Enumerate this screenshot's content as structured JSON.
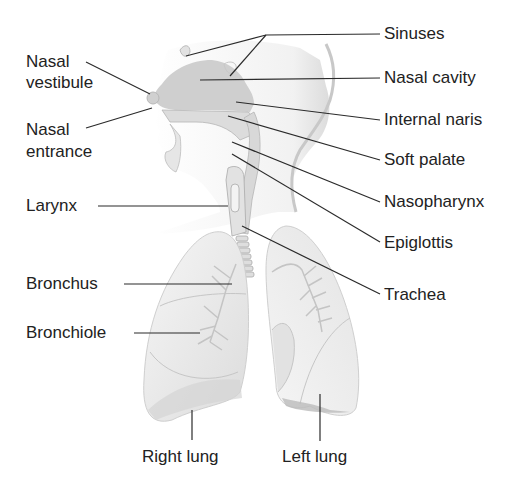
{
  "diagram": {
    "labels": {
      "sinuses": "Sinuses",
      "nasal_cavity": "Nasal cavity",
      "internal_naris": "Internal naris",
      "soft_palate": "Soft palate",
      "nasopharynx": "Nasopharynx",
      "epiglottis": "Epiglottis",
      "trachea": "Trachea",
      "nasal_vestibule_1": "Nasal",
      "nasal_vestibule_2": "vestibule",
      "nasal_entrance_1": "Nasal",
      "nasal_entrance_2": "entrance",
      "larynx": "Larynx",
      "bronchus": "Bronchus",
      "bronchiole": "Bronchiole",
      "right_lung": "Right lung",
      "left_lung": "Left lung"
    },
    "colors": {
      "line": "#2a2a2a",
      "tissue_light": "#ececec",
      "tissue_mid": "#d6d6d6",
      "tissue_dark": "#bdbdbd",
      "text": "#222222"
    }
  }
}
